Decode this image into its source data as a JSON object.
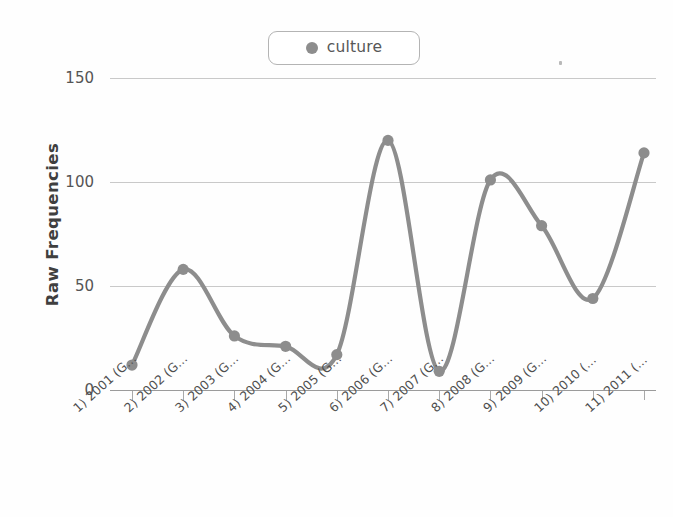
{
  "legend": {
    "entries": [
      {
        "label": "culture",
        "color": "#8d8d8d",
        "marker": "circle-marker"
      }
    ],
    "position": "top-center"
  },
  "axes": {
    "ylabel": "Raw Frequencies",
    "xlabel": "",
    "yticks": [
      "0",
      "50",
      "100",
      "150"
    ],
    "ylim": [
      0,
      150
    ]
  },
  "chart_data": {
    "type": "line",
    "title": "",
    "subtitle": "",
    "xlabel": "",
    "ylabel": "Raw Frequencies",
    "ylim": [
      0,
      150
    ],
    "yticks": [
      0,
      50,
      100,
      150
    ],
    "grid": true,
    "legend_position": "top-center",
    "categories": [
      "1) 2001 (G...",
      "2) 2002 (G...",
      "3) 2003 (G...",
      "4) 2004 (G...",
      "5) 2005 (G...",
      "6) 2006 (G...",
      "7) 2007 (G...",
      "8) 2008 (G...",
      "9) 2009 (G...",
      "10) 2010 (...",
      "11) 2011 (..."
    ],
    "series": [
      {
        "name": "culture",
        "color": "#8d8d8d",
        "marker": "circle",
        "smoothing": "spline",
        "values": [
          12,
          58,
          26,
          21,
          17,
          120,
          9,
          101,
          79,
          44,
          114
        ]
      }
    ]
  },
  "colors": {
    "series": "#8d8d8d",
    "gridline": "#c9c9c9",
    "axis": "#9b9b9b",
    "text": "#4e4e4e",
    "background": "#ffffff"
  }
}
